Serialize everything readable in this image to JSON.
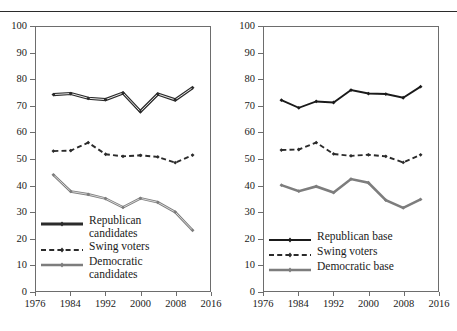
{
  "page": {
    "running_head": "",
    "rule": true
  },
  "chart_data": [
    {
      "type": "line",
      "panel": "left",
      "title": "",
      "xlabel": "",
      "ylabel": "",
      "xlim": [
        1976,
        2016
      ],
      "ylim": [
        0,
        100
      ],
      "grid": false,
      "legend_position": "inside-lower-left",
      "xticks": [
        "1976",
        "1984",
        "1992",
        "2000",
        "2008",
        "2016"
      ],
      "xtick_values": [
        1976,
        1984,
        1992,
        2000,
        2008,
        2016
      ],
      "yticks": [
        "0",
        "10",
        "20",
        "30",
        "40",
        "50",
        "60",
        "70",
        "80",
        "90",
        "100"
      ],
      "ytick_values": [
        0,
        10,
        20,
        30,
        40,
        50,
        60,
        70,
        80,
        90,
        100
      ],
      "x": [
        1980,
        1984,
        1988,
        1992,
        1996,
        2000,
        2004,
        2008,
        2012
      ],
      "series": [
        {
          "name": "Republican candidates",
          "label_line1": "Republican",
          "label_line2": "candidates",
          "style": "solid-double",
          "color": "#2b2b2b",
          "values": [
            74.4,
            74.8,
            73.0,
            72.5,
            75.0,
            68.0,
            74.6,
            72.4,
            77.0
          ]
        },
        {
          "name": "Swing voters",
          "label_line1": "Swing voters",
          "label_line2": "",
          "style": "dashed",
          "color": "#2b2b2b",
          "values": [
            53.0,
            53.2,
            56.2,
            51.8,
            51.0,
            51.4,
            50.8,
            48.6,
            51.5
          ]
        },
        {
          "name": "Democratic candidates",
          "label_line1": "Democratic",
          "label_line2": "candidates",
          "style": "solid-grey",
          "color": "#7d7d7d",
          "values": [
            44.0,
            37.7,
            36.6,
            35.0,
            31.7,
            35.1,
            33.6,
            29.9,
            23.0
          ]
        }
      ]
    },
    {
      "type": "line",
      "panel": "right",
      "title": "",
      "xlabel": "",
      "ylabel": "",
      "xlim": [
        1976,
        2016
      ],
      "ylim": [
        0,
        100
      ],
      "grid": false,
      "legend_position": "inside-lower-left",
      "xticks": [
        "1976",
        "1984",
        "1992",
        "2000",
        "2008",
        "2016"
      ],
      "xtick_values": [
        1976,
        1984,
        1992,
        2000,
        2008,
        2016
      ],
      "yticks": [
        "0",
        "10",
        "20",
        "30",
        "40",
        "50",
        "60",
        "70",
        "80",
        "90",
        "100"
      ],
      "ytick_values": [
        0,
        10,
        20,
        30,
        40,
        50,
        60,
        70,
        80,
        90,
        100
      ],
      "x": [
        1980,
        1984,
        1988,
        1992,
        1996,
        2000,
        2004,
        2008,
        2012
      ],
      "series": [
        {
          "name": "Republican base",
          "label_line1": "Republican base",
          "label_line2": "",
          "style": "solid-black",
          "color": "#1a1a1a",
          "values": [
            72.3,
            69.4,
            71.8,
            71.4,
            76.1,
            74.8,
            74.6,
            73.2,
            77.4
          ]
        },
        {
          "name": "Swing voters",
          "label_line1": "Swing voters",
          "label_line2": "",
          "style": "dashed",
          "color": "#2b2b2b",
          "values": [
            53.4,
            53.6,
            56.2,
            51.9,
            51.2,
            51.6,
            51.0,
            48.7,
            51.6
          ]
        },
        {
          "name": "Democratic base",
          "label_line1": "Democratic base",
          "label_line2": "",
          "style": "solid-grey",
          "color": "#7d7d7d",
          "values": [
            40.1,
            37.8,
            39.6,
            37.3,
            42.4,
            41.0,
            34.4,
            31.5,
            34.7
          ]
        }
      ]
    }
  ]
}
